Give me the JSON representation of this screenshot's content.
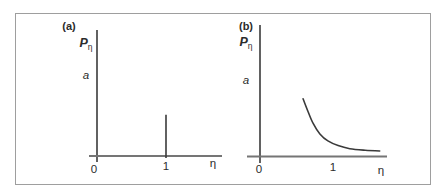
{
  "figure": {
    "panels": [
      {
        "label": "(a)",
        "y_axis_symbol": "P",
        "y_axis_subscript": "η",
        "y_mark": "a",
        "x_tick_0": "0",
        "x_tick_1": "1",
        "x_axis_symbol": "η"
      },
      {
        "label": "(b)",
        "y_axis_symbol": "P",
        "y_axis_subscript": "η",
        "y_mark": "a",
        "x_tick_0": "0",
        "x_tick_1": "1",
        "x_axis_symbol": "η"
      }
    ]
  },
  "colors": {
    "axis": "#3a3a3a",
    "x_axis": "#757575",
    "curve": "#3a3a3a",
    "frame": "#9e9e9e",
    "background": "#ffffff",
    "text": "#2b2b2b"
  },
  "chart_data": [
    {
      "type": "line",
      "panel": "(a)",
      "subtype": "delta_spike",
      "title": "(a)",
      "xlabel": "η",
      "ylabel": "Pη",
      "x_ticks": [
        0,
        1
      ],
      "y_axis_mark": "a",
      "xlim": [
        0,
        1.8
      ],
      "spike": {
        "x": 1,
        "height_in_units_of_a": 0.53
      },
      "annotation": "single narrow vertical spike at η = 1; P_η is zero elsewhere"
    },
    {
      "type": "line",
      "panel": "(b)",
      "title": "(b)",
      "xlabel": "η",
      "ylabel": "Pη",
      "x_ticks": [
        0,
        1
      ],
      "y_axis_mark": "a",
      "xlim": [
        0,
        1.75
      ],
      "x": [
        0.59,
        0.66,
        0.73,
        0.82,
        0.93,
        1.07,
        1.23,
        1.44,
        1.64
      ],
      "y_in_units_of_a": [
        0.74,
        0.57,
        0.42,
        0.29,
        0.2,
        0.14,
        0.1,
        0.08,
        0.07
      ],
      "annotation": "smooth monotonically decaying curve approaching the η axis asymptotically"
    }
  ]
}
